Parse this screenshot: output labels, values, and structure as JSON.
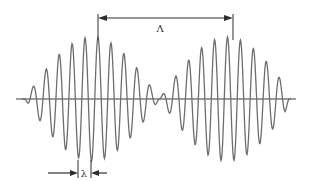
{
  "diagram": {
    "type": "beat-wave",
    "labels": {
      "beat_wavelength": "Λ",
      "carrier_wavelength": "λ"
    },
    "geometry": {
      "axis": {
        "x1": 16,
        "x2": 296,
        "y": 99
      },
      "carrier_period_px": 12.95,
      "beat_period_px": 135,
      "peak_amplitude_px": 62,
      "first_packet_center_x": 92,
      "carrier_peak_anchor_x": 98,
      "envelope_node_x": 159,
      "wave_start_x": 22,
      "wave_end_x": 291
    },
    "annotations": {
      "top_arrow": {
        "x1": 98,
        "x2": 233,
        "y": 18,
        "label_x": 160,
        "label_y": 32
      },
      "bottom_arrow": {
        "left_x": 78,
        "right_x": 91,
        "y": 173,
        "label_x": 84,
        "label_y": 177
      }
    },
    "colors": {
      "wave": "#6e6e6e",
      "axis": "#3a3a3a",
      "arrows": "#2e2e2e"
    }
  }
}
